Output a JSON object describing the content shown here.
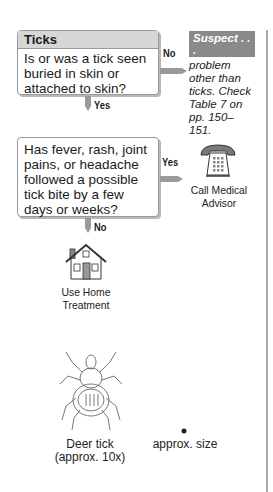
{
  "flowchart": {
    "box1": {
      "header": "Ticks",
      "question": "Is or was a tick seen buried in skin or attached to skin?"
    },
    "box1_no_label": "No",
    "box1_yes_label": "Yes",
    "suspect": {
      "header": "Suspect . . .",
      "text": "problem other than ticks. Check Table 7 on pp. 150–151."
    },
    "box2": {
      "question": "Has fever, rash, joint pains, or headache followed a possible tick bite by a few days or weeks?"
    },
    "box2_yes_label": "Yes",
    "box2_no_label": "No",
    "call_medical": {
      "icon": "telephone-icon",
      "label_line1": "Call Medical",
      "label_line2": "Advisor"
    },
    "home_treatment": {
      "icon": "house-icon",
      "label_line1": "Use Home",
      "label_line2": "Treatment"
    }
  },
  "illustration": {
    "deer_tick_line1": "Deer tick",
    "deer_tick_line2": "(approx. 10x)",
    "actual_size_label": "approx. size"
  },
  "colors": {
    "header_gray": "#d6d6d6",
    "suspect_gray": "#8a8a8a",
    "arrow_gray": "#9a9a9a"
  }
}
